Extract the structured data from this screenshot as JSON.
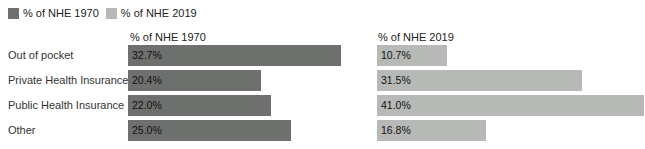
{
  "chart_data": {
    "type": "bar",
    "orientation": "horizontal",
    "layout": "two-column grouped bars, one column per series",
    "categories": [
      "Out of pocket",
      "Private Health Insurance",
      "Public Health Insurance",
      "Other"
    ],
    "series": [
      {
        "name": "% of NHE 1970",
        "color": "#6e706e",
        "values": [
          32.7,
          20.4,
          22.0,
          25.0
        ],
        "labels": [
          "32.7%",
          "20.4%",
          "22.0%",
          "25.0%"
        ]
      },
      {
        "name": "% of NHE 2019",
        "color": "#b7b9b7",
        "values": [
          10.7,
          31.5,
          41.0,
          16.8
        ],
        "labels": [
          "10.7%",
          "31.5%",
          "41.0%",
          "16.8%"
        ]
      }
    ],
    "column_headers": [
      "% of NHE 1970",
      "% of NHE 2019"
    ],
    "xlim": [
      0,
      41
    ],
    "grid": false,
    "legend_position": "top-left",
    "value_label_position": "inside-start",
    "value_label_color": "#111111",
    "background_color": "#ffffff"
  }
}
